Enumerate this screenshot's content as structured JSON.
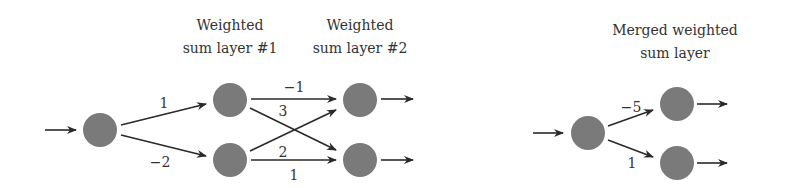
{
  "colors": {
    "node": "#7a7a7a",
    "edge": "#2a2a2a",
    "text": "#333333"
  },
  "left_diagram": {
    "layer1_title": [
      "Weighted",
      "sum layer #1"
    ],
    "layer2_title": [
      "Weighted",
      "sum layer #2"
    ],
    "input_to_layer1": {
      "top_weight": "1",
      "bottom_weight": "−2"
    },
    "layer1_to_layer2": {
      "top_to_top": "−1",
      "top_to_bottom": "3",
      "bottom_to_top": "2",
      "bottom_to_bottom": "1"
    }
  },
  "right_diagram": {
    "title": [
      "Merged weighted",
      "sum layer"
    ],
    "weights": {
      "top": "−5",
      "bottom": "1"
    }
  }
}
